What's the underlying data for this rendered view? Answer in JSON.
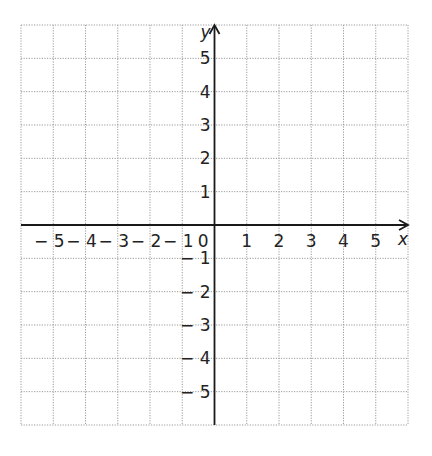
{
  "diagram": {
    "type": "cartesian-coordinate-grid",
    "x_axis": {
      "label": "x",
      "range": [
        -6,
        6
      ],
      "tick_labels": [
        {
          "value": -5,
          "text": "− 5"
        },
        {
          "value": -4,
          "text": "− 4"
        },
        {
          "value": -3,
          "text": "− 3"
        },
        {
          "value": -2,
          "text": "− 2"
        },
        {
          "value": -1,
          "text": "− 1"
        },
        {
          "value": 1,
          "text": "1"
        },
        {
          "value": 2,
          "text": "2"
        },
        {
          "value": 3,
          "text": "3"
        },
        {
          "value": 4,
          "text": "4"
        },
        {
          "value": 5,
          "text": "5"
        }
      ]
    },
    "y_axis": {
      "label": "y",
      "range": [
        -6,
        6
      ],
      "tick_labels": [
        {
          "value": 5,
          "text": "5"
        },
        {
          "value": 4,
          "text": "4"
        },
        {
          "value": 3,
          "text": "3"
        },
        {
          "value": 2,
          "text": "2"
        },
        {
          "value": 1,
          "text": "1"
        },
        {
          "value": -1,
          "text": "− 1"
        },
        {
          "value": -2,
          "text": "− 2"
        },
        {
          "value": -3,
          "text": "− 3"
        },
        {
          "value": -4,
          "text": "− 4"
        },
        {
          "value": -5,
          "text": "− 5"
        }
      ]
    },
    "origin_label": "0",
    "grid": {
      "style": "dotted",
      "columns": 12,
      "rows": 12,
      "color": "#9a9a9a"
    },
    "axis_color": "#1a1a1a"
  }
}
